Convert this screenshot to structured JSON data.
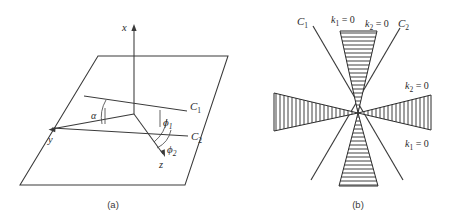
{
  "figure": {
    "background_color": "#ffffff",
    "line_color": "#3a3a3a",
    "text_color": "#2b2b2b",
    "width": 458,
    "height": 219
  },
  "panel_a": {
    "caption": "(a)",
    "description": "Three-dimensional coordinate system with an inclined plane containing two characteristic directions",
    "axes": [
      {
        "name": "x-axis",
        "label": "x",
        "subscript": "",
        "direction": "up"
      },
      {
        "name": "y-axis",
        "label": "y",
        "subscript": "",
        "direction": "lower-left"
      },
      {
        "name": "z-axis",
        "label": "z",
        "subscript": "",
        "direction": "lower-right"
      }
    ],
    "characteristic_lines": [
      {
        "name": "C1",
        "label": "C",
        "subscript": "1"
      },
      {
        "name": "C2",
        "label": "C",
        "subscript": "2"
      }
    ],
    "angles": [
      {
        "name": "alpha",
        "label": "α",
        "subscript": "",
        "between": "C1 and y-axis"
      },
      {
        "name": "phi1",
        "label": "ϕ",
        "subscript": "1",
        "between": "C1 and z-axis"
      },
      {
        "name": "phi2",
        "label": "ϕ",
        "subscript": "2",
        "between": "C2 and z-axis"
      }
    ]
  },
  "panel_b": {
    "caption": "(b)",
    "description": "Four hatched characteristic wedges meeting at a point with two crossing characteristic lines",
    "characteristic_lines": [
      {
        "name": "C1",
        "label": "C",
        "subscript": "1"
      },
      {
        "name": "C2",
        "label": "C",
        "subscript": "2"
      }
    ],
    "wedge_labels": [
      {
        "name": "k1-zero-top",
        "label": "k",
        "subscript": "1",
        "equals": " = 0",
        "position": "top-left"
      },
      {
        "name": "k2-zero-top",
        "label": "k",
        "subscript": "2",
        "equals": " = 0",
        "position": "top-right"
      },
      {
        "name": "k2-zero-right",
        "label": "k",
        "subscript": "2",
        "equals": " = 0",
        "position": "right-upper"
      },
      {
        "name": "k1-zero-right",
        "label": "k",
        "subscript": "1",
        "equals": " = 0",
        "position": "right-lower"
      }
    ],
    "wedges": [
      {
        "name": "wedge-top",
        "hatching": "horizontal",
        "orientation": "up"
      },
      {
        "name": "wedge-bottom",
        "hatching": "horizontal",
        "orientation": "down"
      },
      {
        "name": "wedge-left",
        "hatching": "vertical",
        "orientation": "left"
      },
      {
        "name": "wedge-right",
        "hatching": "vertical",
        "orientation": "right"
      }
    ]
  }
}
